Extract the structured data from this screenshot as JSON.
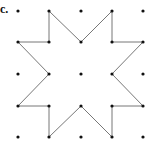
{
  "label": "c.",
  "grid": {
    "cols": 5,
    "rows": 5,
    "dot_color": "#111111"
  },
  "line_color": "#777777",
  "star_vertices": [
    [
      1,
      0
    ],
    [
      2,
      1
    ],
    [
      3,
      0
    ],
    [
      3,
      1
    ],
    [
      4,
      1
    ],
    [
      3,
      2
    ],
    [
      4,
      3
    ],
    [
      3,
      3
    ],
    [
      3,
      4
    ],
    [
      2,
      3
    ],
    [
      1,
      4
    ],
    [
      1,
      3
    ],
    [
      0,
      3
    ],
    [
      1,
      2
    ],
    [
      0,
      1
    ],
    [
      1,
      1
    ]
  ]
}
